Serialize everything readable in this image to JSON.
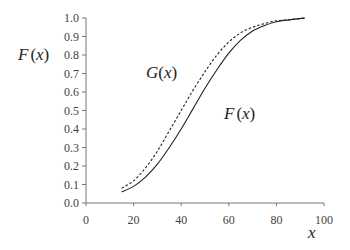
{
  "chart_data": {
    "type": "line",
    "title": "",
    "xlabel": "x",
    "ylabel": "F(x)",
    "xlim": [
      0,
      100
    ],
    "ylim": [
      0.0,
      1.0
    ],
    "grid": false,
    "xticks": [
      "0",
      "20",
      "40",
      "60",
      "80",
      "100"
    ],
    "yticks": [
      "0.0",
      "0.1",
      "0.2",
      "0.3",
      "0.4",
      "0.5",
      "0.6",
      "0.7",
      "0.8",
      "0.9",
      "1.0"
    ],
    "annotations": [
      {
        "text": "G(x)",
        "near": "upper-left of curves"
      },
      {
        "text": "F(x)",
        "near": "right of solid curve"
      }
    ],
    "series": [
      {
        "name": "F(x)",
        "style": "solid",
        "x": [
          15,
          20,
          25,
          30,
          35,
          40,
          45,
          50,
          55,
          60,
          65,
          70,
          75,
          80,
          85,
          92
        ],
        "y": [
          0.06,
          0.09,
          0.14,
          0.21,
          0.3,
          0.4,
          0.51,
          0.62,
          0.72,
          0.81,
          0.88,
          0.93,
          0.96,
          0.98,
          0.99,
          1.0
        ]
      },
      {
        "name": "G(x)",
        "style": "dashed",
        "x": [
          15,
          20,
          25,
          30,
          35,
          40,
          45,
          50,
          55,
          60,
          65,
          70,
          75,
          80,
          85,
          92
        ],
        "y": [
          0.08,
          0.12,
          0.19,
          0.28,
          0.39,
          0.5,
          0.61,
          0.71,
          0.8,
          0.87,
          0.92,
          0.95,
          0.97,
          0.985,
          0.99,
          1.0
        ]
      }
    ]
  }
}
